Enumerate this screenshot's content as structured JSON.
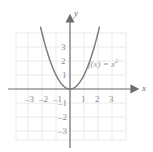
{
  "figure": {
    "background_color": "#ffffff",
    "grid_color": "#e2e2e2",
    "axis_color": "#6f6f6f",
    "curve_color": "#7d7d7d",
    "label_color": "#8d8d8d"
  },
  "axes": {
    "x_name": "x",
    "y_name": "y",
    "x_ticks": [
      "–3",
      "–2",
      "–1",
      "1",
      "2",
      "3"
    ],
    "y_ticks": [
      "3",
      "2",
      "1",
      "–1",
      "–2",
      "–3"
    ]
  },
  "chart_data": {
    "type": "line",
    "title": "",
    "xlabel": "x",
    "ylabel": "y",
    "xlim": [
      -4,
      4
    ],
    "ylim": [
      -4,
      4
    ],
    "grid": true,
    "legend": "none",
    "annotations": [
      {
        "text_base": "f(x) = x",
        "text_exponent": "2",
        "text_full": "f(x) = x²",
        "x": 1.6,
        "y": 1.9
      }
    ],
    "series": [
      {
        "name": "f(x) = x²",
        "equation": "y = x^2",
        "x": [
          -2.1,
          -2.0,
          -1.75,
          -1.5,
          -1.25,
          -1.0,
          -0.75,
          -0.5,
          -0.25,
          0,
          0.25,
          0.5,
          0.75,
          1.0,
          1.25,
          1.5,
          1.75,
          2.0,
          2.1
        ],
        "y": [
          4.41,
          4.0,
          3.0625,
          2.25,
          1.5625,
          1.0,
          0.5625,
          0.25,
          0.0625,
          0,
          0.0625,
          0.25,
          0.5625,
          1.0,
          1.5625,
          2.25,
          3.0625,
          4.0,
          4.41
        ]
      }
    ],
    "x_tick_values": [
      -3,
      -2,
      -1,
      1,
      2,
      3
    ],
    "y_tick_values": [
      3,
      2,
      1,
      -1,
      -2,
      -3
    ]
  }
}
